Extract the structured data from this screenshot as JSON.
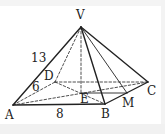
{
  "figure": {
    "type": "square-based pyramid",
    "points": {
      "V": {
        "label": "V",
        "x": 81,
        "y": 27
      },
      "A": {
        "label": "A",
        "x": 13,
        "y": 105
      },
      "B": {
        "label": "B",
        "x": 105,
        "y": 104
      },
      "C": {
        "label": "C",
        "x": 148,
        "y": 82
      },
      "D": {
        "label": "D",
        "x": 55,
        "y": 82
      },
      "E": {
        "label": "E",
        "x": 81,
        "y": 93
      },
      "M": {
        "label": "M",
        "x": 127,
        "y": 93
      }
    },
    "measurements": {
      "VA": "13",
      "AD": "6",
      "AB": "8"
    },
    "colors": {
      "line": "#222222",
      "background": "#ffffff"
    }
  }
}
